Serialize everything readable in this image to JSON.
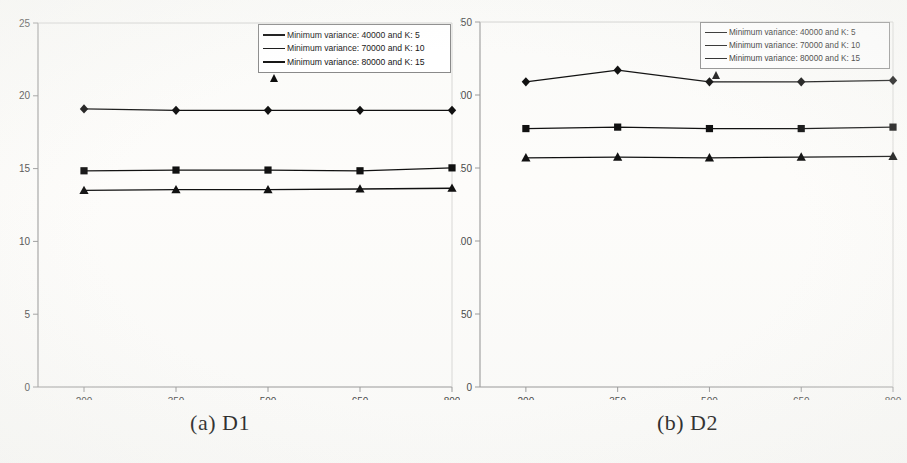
{
  "figure": {
    "background_color": "#fdfdfb",
    "ink_color": "#111111",
    "axis_color": "#9a9a9a"
  },
  "panels": [
    {
      "id": "a",
      "caption": "(a) D1",
      "legend": {
        "border_color": "#8a8a8a",
        "entries": [
          {
            "marker": "diamond",
            "label": "Minimum variance: 40000 and K: 5"
          },
          {
            "marker": "square",
            "label": "Minimum variance: 70000 and K: 10"
          },
          {
            "marker": "triangle",
            "label": "Minimum variance: 80000 and K: 15"
          }
        ]
      },
      "chart_data": {
        "type": "line",
        "title": "",
        "xlabel": "",
        "ylabel": "",
        "categories": [
          "200",
          "350",
          "500",
          "650",
          "800"
        ],
        "x": [
          200,
          350,
          500,
          650,
          800
        ],
        "xlim": [
          125,
          800
        ],
        "ylim": [
          0,
          25
        ],
        "yticks": [
          0,
          5,
          10,
          15,
          20,
          25
        ],
        "xticks": [
          200,
          350,
          500,
          650,
          800
        ],
        "grid": false,
        "legend_position": "top-right",
        "series": [
          {
            "name": "Minimum variance: 40000 and K: 5",
            "marker": "diamond",
            "values": [
              19.1,
              19.0,
              19.0,
              19.0,
              19.0
            ]
          },
          {
            "name": "Minimum variance: 70000 and K: 10",
            "marker": "square",
            "values": [
              14.85,
              14.9,
              14.9,
              14.85,
              15.05
            ]
          },
          {
            "name": "Minimum variance: 80000 and K: 15",
            "marker": "triangle",
            "values": [
              13.5,
              13.55,
              13.55,
              13.6,
              13.65
            ]
          }
        ]
      }
    },
    {
      "id": "b",
      "caption": "(b) D2",
      "legend": {
        "border_color": "#8a8a8a",
        "entries": [
          {
            "marker": "diamond",
            "label": "Minimum variance: 40000 and K: 5"
          },
          {
            "marker": "square",
            "label": "Minimum variance: 70000 and K: 10"
          },
          {
            "marker": "triangle",
            "label": "Minimum variance: 80000 and K: 15"
          }
        ]
      },
      "chart_data": {
        "type": "line",
        "title": "",
        "xlabel": "",
        "ylabel": "",
        "categories": [
          "200",
          "350",
          "500",
          "650",
          "800"
        ],
        "x": [
          200,
          350,
          500,
          650,
          800
        ],
        "xlim": [
          125,
          800
        ],
        "ylim": [
          0,
          250
        ],
        "yticks": [
          0,
          50,
          100,
          150,
          200,
          250
        ],
        "xticks": [
          200,
          350,
          500,
          650,
          800
        ],
        "grid": false,
        "legend_position": "top-right",
        "series": [
          {
            "name": "Minimum variance: 40000 and K: 5",
            "marker": "diamond",
            "values": [
              209,
              217,
              209,
              209,
              210
            ]
          },
          {
            "name": "Minimum variance: 70000 and K: 10",
            "marker": "square",
            "values": [
              177,
              178,
              177,
              177,
              178
            ]
          },
          {
            "name": "Minimum variance: 80000 and K: 15",
            "marker": "triangle",
            "values": [
              157,
              157.5,
              157,
              157.5,
              158
            ]
          }
        ]
      }
    }
  ]
}
